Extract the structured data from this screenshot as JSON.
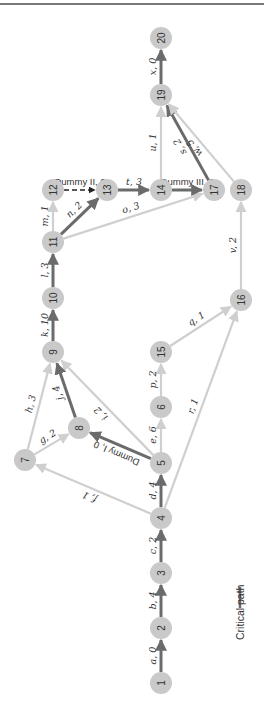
{
  "legend": {
    "label": "Critical path",
    "color": "#6b6b6b"
  },
  "colors": {
    "critical": "#6b6b6b",
    "normal": "#cfcfcf",
    "dummy": "#222222",
    "node": "#c9c9c9"
  },
  "nodes": [
    {
      "id": "1",
      "x": 161,
      "y": 683
    },
    {
      "id": "2",
      "x": 161,
      "y": 628
    },
    {
      "id": "3",
      "x": 161,
      "y": 573
    },
    {
      "id": "4",
      "x": 161,
      "y": 518
    },
    {
      "id": "5",
      "x": 161,
      "y": 463
    },
    {
      "id": "6",
      "x": 161,
      "y": 407
    },
    {
      "id": "7",
      "x": 25,
      "y": 460
    },
    {
      "id": "8",
      "x": 79,
      "y": 428
    },
    {
      "id": "9",
      "x": 53,
      "y": 352
    },
    {
      "id": "10",
      "x": 53,
      "y": 298
    },
    {
      "id": "11",
      "x": 53,
      "y": 242
    },
    {
      "id": "12",
      "x": 53,
      "y": 190
    },
    {
      "id": "13",
      "x": 107,
      "y": 190
    },
    {
      "id": "14",
      "x": 161,
      "y": 190
    },
    {
      "id": "15",
      "x": 161,
      "y": 352
    },
    {
      "id": "16",
      "x": 241,
      "y": 300
    },
    {
      "id": "17",
      "x": 214,
      "y": 190
    },
    {
      "id": "18",
      "x": 241,
      "y": 190
    },
    {
      "id": "19",
      "x": 161,
      "y": 95
    },
    {
      "id": "20",
      "x": 161,
      "y": 38
    }
  ],
  "edges": [
    {
      "from": "1",
      "to": "2",
      "label": "a, 0",
      "type": "critical"
    },
    {
      "from": "2",
      "to": "3",
      "label": "b, 4",
      "type": "critical"
    },
    {
      "from": "3",
      "to": "4",
      "label": "c, 2",
      "type": "critical"
    },
    {
      "from": "4",
      "to": "5",
      "label": "d, 4",
      "type": "critical"
    },
    {
      "from": "5",
      "to": "6",
      "label": "e, 6",
      "type": "normal"
    },
    {
      "from": "4",
      "to": "7",
      "label": "f, 1",
      "type": "normal"
    },
    {
      "from": "7",
      "to": "8",
      "label": "g, 2",
      "type": "normal"
    },
    {
      "from": "7",
      "to": "9",
      "label": "h, 3",
      "type": "normal"
    },
    {
      "from": "5",
      "to": "9",
      "label": "i, 2",
      "type": "normal"
    },
    {
      "from": "5",
      "to": "8",
      "label": "Dummy I, 0",
      "type": "critical-dummy"
    },
    {
      "from": "8",
      "to": "9",
      "label": "j, 4",
      "type": "critical"
    },
    {
      "from": "9",
      "to": "10",
      "label": "k, 10",
      "type": "critical"
    },
    {
      "from": "10",
      "to": "11",
      "label": "l, 3",
      "type": "critical"
    },
    {
      "from": "11",
      "to": "12",
      "label": "m, 1",
      "type": "normal"
    },
    {
      "from": "11",
      "to": "13",
      "label": "n, 2",
      "type": "critical"
    },
    {
      "from": "11",
      "to": "17",
      "label": "o, 3",
      "type": "normal"
    },
    {
      "from": "6",
      "to": "15",
      "label": "p, 2",
      "type": "normal"
    },
    {
      "from": "15",
      "to": "16",
      "label": "q, 1",
      "type": "normal"
    },
    {
      "from": "4",
      "to": "16",
      "label": "r, 1",
      "type": "normal"
    },
    {
      "from": "17",
      "to": "19",
      "label": "s, 2",
      "type": "critical"
    },
    {
      "from": "13",
      "to": "14",
      "label": "t, 3",
      "type": "critical"
    },
    {
      "from": "14",
      "to": "19",
      "label": "u, 1",
      "type": "normal"
    },
    {
      "from": "16",
      "to": "18",
      "label": "v, 2",
      "type": "normal"
    },
    {
      "from": "18",
      "to": "19",
      "label": "w, 5",
      "type": "normal"
    },
    {
      "from": "19",
      "to": "20",
      "label": "x, 0",
      "type": "critical"
    },
    {
      "from": "12",
      "to": "13",
      "label": "Dummy II, 0",
      "type": "dummy"
    },
    {
      "from": "14",
      "to": "17",
      "label": "Dummy III, 0",
      "type": "critical"
    }
  ]
}
